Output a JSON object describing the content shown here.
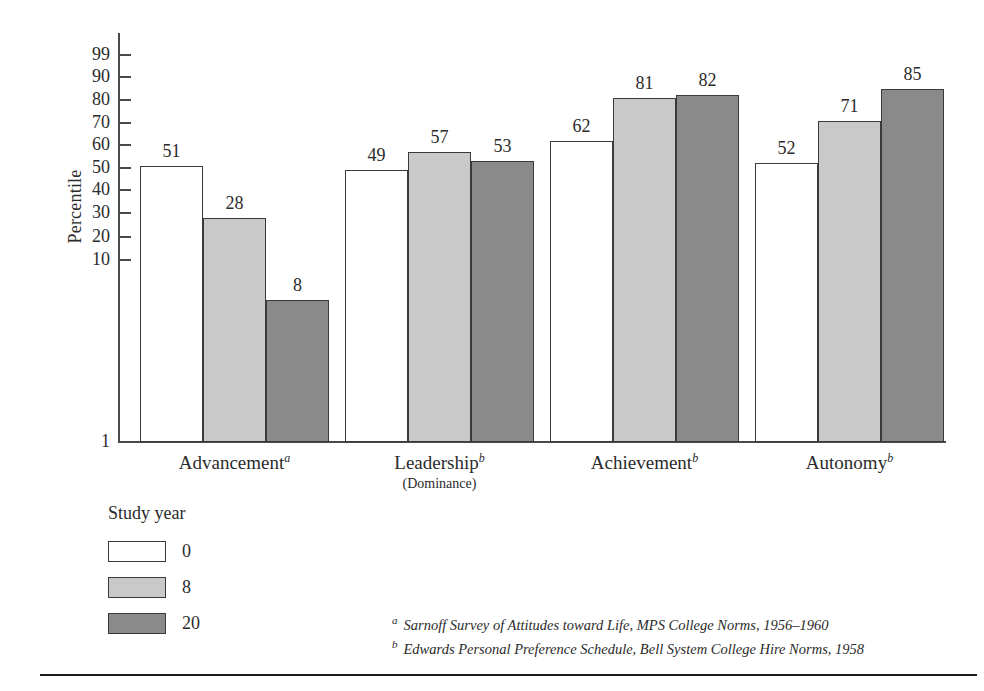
{
  "chart_data": {
    "type": "bar",
    "title": "",
    "xlabel": "",
    "ylabel": "Percentile",
    "ylim": [
      1,
      99
    ],
    "grid": false,
    "scale": "normal-probability",
    "legend_position": "below-left",
    "categories": [
      "Advancement",
      "Leadership",
      "Achievement",
      "Autonomy"
    ],
    "category_notes": [
      "a",
      "b",
      "b",
      "b"
    ],
    "category_subtitles": [
      "",
      "(Dominance)",
      "",
      ""
    ],
    "series": [
      {
        "name": "0",
        "values": [
          51,
          49,
          62,
          52
        ],
        "color": "#ffffff"
      },
      {
        "name": "8",
        "values": [
          28,
          57,
          81,
          71
        ],
        "color": "#c9c9c9"
      },
      {
        "name": "20",
        "values": [
          8,
          53,
          82,
          85
        ],
        "color": "#8a8a8a"
      }
    ],
    "ytick_labels": [
      "99",
      "90",
      "80",
      "70",
      "60",
      "50",
      "40",
      "30",
      "20",
      "10",
      "1"
    ],
    "ytick_values": [
      99,
      90,
      80,
      70,
      60,
      50,
      40,
      30,
      20,
      10,
      1
    ]
  },
  "axis": {
    "ylabel": "Percentile",
    "ticks": [
      {
        "label": "99",
        "value": 99
      },
      {
        "label": "90",
        "value": 90
      },
      {
        "label": "80",
        "value": 80
      },
      {
        "label": "70",
        "value": 70
      },
      {
        "label": "60",
        "value": 60
      },
      {
        "label": "50",
        "value": 50
      },
      {
        "label": "40",
        "value": 40
      },
      {
        "label": "30",
        "value": 30
      },
      {
        "label": "20",
        "value": 20
      },
      {
        "label": "10",
        "value": 10
      },
      {
        "label": "1",
        "value": 1
      }
    ]
  },
  "categories": [
    {
      "label": "Advancement",
      "note": "a",
      "subtitle": ""
    },
    {
      "label": "Leadership",
      "note": "b",
      "subtitle": "(Dominance)"
    },
    {
      "label": "Achievement",
      "note": "b",
      "subtitle": ""
    },
    {
      "label": "Autonomy",
      "note": "b",
      "subtitle": ""
    }
  ],
  "bars": [
    {
      "group": "Advancement",
      "series": "0",
      "value": 51
    },
    {
      "group": "Advancement",
      "series": "8",
      "value": 28
    },
    {
      "group": "Advancement",
      "series": "20",
      "value": 8
    },
    {
      "group": "Leadership",
      "series": "0",
      "value": 49
    },
    {
      "group": "Leadership",
      "series": "8",
      "value": 57
    },
    {
      "group": "Leadership",
      "series": "20",
      "value": 53
    },
    {
      "group": "Achievement",
      "series": "0",
      "value": 62
    },
    {
      "group": "Achievement",
      "series": "8",
      "value": 81
    },
    {
      "group": "Achievement",
      "series": "20",
      "value": 82
    },
    {
      "group": "Autonomy",
      "series": "0",
      "value": 52
    },
    {
      "group": "Autonomy",
      "series": "8",
      "value": 71
    },
    {
      "group": "Autonomy",
      "series": "20",
      "value": 85
    }
  ],
  "legend": {
    "title": "Study year",
    "items": [
      {
        "label": "0",
        "color": "#ffffff"
      },
      {
        "label": "8",
        "color": "#c9c9c9"
      },
      {
        "label": "20",
        "color": "#8a8a8a"
      }
    ]
  },
  "footnotes": [
    {
      "mark": "a",
      "text": "Sarnoff Survey of Attitudes toward Life, MPS College Norms, 1956–1960"
    },
    {
      "mark": "b",
      "text": "Edwards Personal Preference Schedule, Bell System College Hire Norms, 1958"
    }
  ]
}
